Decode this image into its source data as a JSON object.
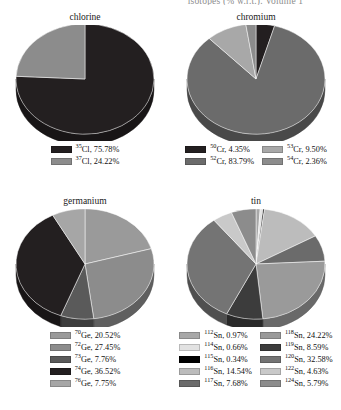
{
  "running_head": "isotopes (% w.r.t.). Volume 1",
  "chart_data": [
    {
      "type": "pie",
      "title": "chlorine",
      "categories": [
        "35Cl",
        "37Cl"
      ],
      "labels": [
        "35Cl, 75.78%",
        "37Cl, 24.22%"
      ],
      "values": [
        75.78,
        24.22
      ],
      "colors": [
        "#231f20",
        "#8c8c8c"
      ],
      "legend_position": "bottom",
      "legend_columns": 1,
      "start_angle_deg": 0,
      "direction": "clockwise",
      "isotope_masses": [
        35,
        37
      ],
      "element_symbol": "Cl",
      "unit": "%"
    },
    {
      "type": "pie",
      "title": "chromium",
      "categories": [
        "50Cr",
        "52Cr",
        "53Cr",
        "54Cr"
      ],
      "labels": [
        "50Cr, 4.35%",
        "52Cr, 83.79%",
        "53Cr, 9.50%",
        "54Cr, 2.36%"
      ],
      "values": [
        4.35,
        83.79,
        9.5,
        2.36
      ],
      "colors": [
        "#231f20",
        "#6b6b6b",
        "#a8a8a8",
        "#8c8c8c"
      ],
      "legend_position": "bottom",
      "legend_columns": 2,
      "start_angle_deg": 0,
      "direction": "clockwise",
      "isotope_masses": [
        50,
        52,
        53,
        54
      ],
      "element_symbol": "Cr",
      "unit": "%"
    },
    {
      "type": "pie",
      "title": "germanium",
      "categories": [
        "70Ge",
        "72Ge",
        "73Ge",
        "74Ge",
        "76Ge"
      ],
      "labels": [
        "70Ge, 20.52%",
        "72Ge, 27.45%",
        "73Ge, 7.76%",
        "74Ge, 36.52%",
        "76Ge, 7.75%"
      ],
      "values": [
        20.52,
        27.45,
        7.76,
        36.52,
        7.75
      ],
      "colors": [
        "#9a9a9a",
        "#8c8c8c",
        "#5a5a5a",
        "#231f20",
        "#a6a6a6"
      ],
      "legend_position": "bottom",
      "legend_columns": 1,
      "start_angle_deg": 0,
      "direction": "clockwise",
      "isotope_masses": [
        70,
        72,
        73,
        74,
        76
      ],
      "element_symbol": "Ge",
      "unit": "%"
    },
    {
      "type": "pie",
      "title": "tin",
      "categories": [
        "112Sn",
        "114Sn",
        "115Sn",
        "116Sn",
        "117Sn",
        "118Sn",
        "119Sn",
        "120Sn",
        "122Sn",
        "124Sn"
      ],
      "labels": [
        "112Sn, 0.97%",
        "114Sn, 0.66%",
        "115Sn, 0.34%",
        "116Sn, 14.54%",
        "117Sn, 7.68%",
        "118Sn, 24.22%",
        "119Sn, 8.59%",
        "120Sn, 32.58%",
        "122Sn, 4.63%",
        "124Sn, 5.79%"
      ],
      "values": [
        0.97,
        0.66,
        0.34,
        14.54,
        7.68,
        24.22,
        8.59,
        32.58,
        4.63,
        5.79
      ],
      "colors": [
        "#a8a8a8",
        "#e2e2e2",
        "#000000",
        "#bcbcbc",
        "#6b6b6b",
        "#9a9a9a",
        "#3c3c3c",
        "#747474",
        "#c9c9c9",
        "#8c8c8c"
      ],
      "legend_position": "bottom",
      "legend_columns": 2,
      "start_angle_deg": 0,
      "direction": "clockwise",
      "isotope_masses": [
        112,
        114,
        115,
        116,
        117,
        118,
        119,
        120,
        122,
        124
      ],
      "element_symbol": "Sn",
      "unit": "%"
    }
  ]
}
